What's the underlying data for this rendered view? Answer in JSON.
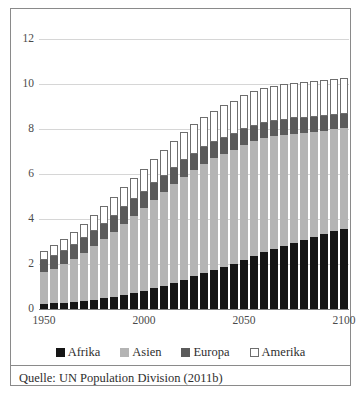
{
  "figure": {
    "source_note": "Quelle: UN Population Division (2011b)"
  },
  "colors": {
    "afrika": "#151515",
    "asien": "#b4b4b4",
    "europa": "#5b5b5b",
    "amerika": "#ffffff",
    "gridline": "#d6d6d6",
    "axis": "#7d7d7d",
    "frame": "#8a8a8a"
  },
  "chart_data": {
    "type": "bar",
    "stacked": true,
    "title": "",
    "xlabel": "",
    "ylabel": "",
    "ylim": [
      0,
      12
    ],
    "yticks": [
      0,
      2,
      4,
      6,
      8,
      10,
      12
    ],
    "ytick_labels": [
      "0",
      "2",
      "4",
      "6",
      "8",
      "10",
      "12"
    ],
    "grid": true,
    "legend_position": "bottom",
    "categories": [
      "1950",
      "1955",
      "1960",
      "1965",
      "1970",
      "1975",
      "1980",
      "1985",
      "1990",
      "1995",
      "2000",
      "2005",
      "2010",
      "2015",
      "2020",
      "2025",
      "2030",
      "2035",
      "2040",
      "2045",
      "2050",
      "2055",
      "2060",
      "2065",
      "2070",
      "2075",
      "2080",
      "2085",
      "2090",
      "2095",
      "2100"
    ],
    "xtick_labels": [
      "1950",
      "2000",
      "2050",
      "2100"
    ],
    "xtick_indices": [
      0,
      10,
      20,
      30
    ],
    "series": [
      {
        "name": "Afrika",
        "color": "#151515",
        "values": [
          0.23,
          0.25,
          0.28,
          0.31,
          0.36,
          0.41,
          0.48,
          0.55,
          0.63,
          0.72,
          0.81,
          0.92,
          1.03,
          1.17,
          1.31,
          1.45,
          1.59,
          1.73,
          1.87,
          2.01,
          2.19,
          2.36,
          2.52,
          2.68,
          2.82,
          2.95,
          3.08,
          3.21,
          3.33,
          3.46,
          3.57
        ]
      },
      {
        "name": "Asien",
        "color": "#b4b4b4",
        "values": [
          1.4,
          1.54,
          1.7,
          1.9,
          2.13,
          2.38,
          2.63,
          2.89,
          3.17,
          3.43,
          3.68,
          3.94,
          4.16,
          4.38,
          4.57,
          4.73,
          4.87,
          4.96,
          5.02,
          5.07,
          5.1,
          5.09,
          5.06,
          5.0,
          4.93,
          4.85,
          4.76,
          4.67,
          4.59,
          4.52,
          4.46
        ]
      },
      {
        "name": "Europa",
        "color": "#5b5b5b",
        "values": [
          0.55,
          0.58,
          0.6,
          0.63,
          0.66,
          0.68,
          0.69,
          0.71,
          0.72,
          0.73,
          0.73,
          0.73,
          0.74,
          0.74,
          0.74,
          0.73,
          0.73,
          0.72,
          0.72,
          0.71,
          0.71,
          0.7,
          0.69,
          0.68,
          0.67,
          0.67,
          0.66,
          0.66,
          0.66,
          0.65,
          0.65
        ]
      },
      {
        "name": "Amerika",
        "color": "#ffffff",
        "values": [
          0.42,
          0.47,
          0.53,
          0.59,
          0.65,
          0.71,
          0.77,
          0.83,
          0.9,
          0.96,
          1.02,
          1.08,
          1.14,
          1.2,
          1.26,
          1.31,
          1.36,
          1.4,
          1.44,
          1.47,
          1.5,
          1.52,
          1.54,
          1.55,
          1.56,
          1.57,
          1.57,
          1.58,
          1.58,
          1.58,
          1.58
        ]
      }
    ],
    "legend": [
      {
        "label": "Afrika",
        "color": "#151515",
        "swatch": "sw-afrika"
      },
      {
        "label": "Asien",
        "color": "#b4b4b4",
        "swatch": "sw-asien"
      },
      {
        "label": "Europa",
        "color": "#5b5b5b",
        "swatch": "sw-europa"
      },
      {
        "label": "Amerika",
        "color": "#ffffff",
        "swatch": "sw-amerika"
      }
    ]
  }
}
